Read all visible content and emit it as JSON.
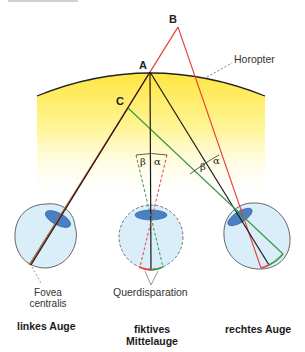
{
  "diagram": {
    "points": {
      "A": {
        "label": "A",
        "x": 150,
        "y": 72
      },
      "B": {
        "label": "B",
        "x": 178,
        "y": 27
      },
      "C": {
        "label": "C",
        "x": 128,
        "y": 108
      }
    },
    "labels": {
      "horopter": "Horopter",
      "fovea_line1": "Fovea",
      "fovea_line2": "centralis",
      "querdisparation": "Querdisparation",
      "left_eye": "linkes Auge",
      "middle_eye_line1": "fiktives",
      "middle_eye_line2": "Mittelauge",
      "right_eye": "rechtes Auge",
      "beta": "β",
      "alpha": "α"
    },
    "colors": {
      "red_line": "#e8403a",
      "black_line": "#1a1a1a",
      "green_line": "#3a9a4a",
      "horopter_fill_top": "#ffe84a",
      "horopter_fill_bottom": "#ffffff",
      "eye_fill": "#d9eef9",
      "lens_fill": "#4a7fc4"
    }
  }
}
